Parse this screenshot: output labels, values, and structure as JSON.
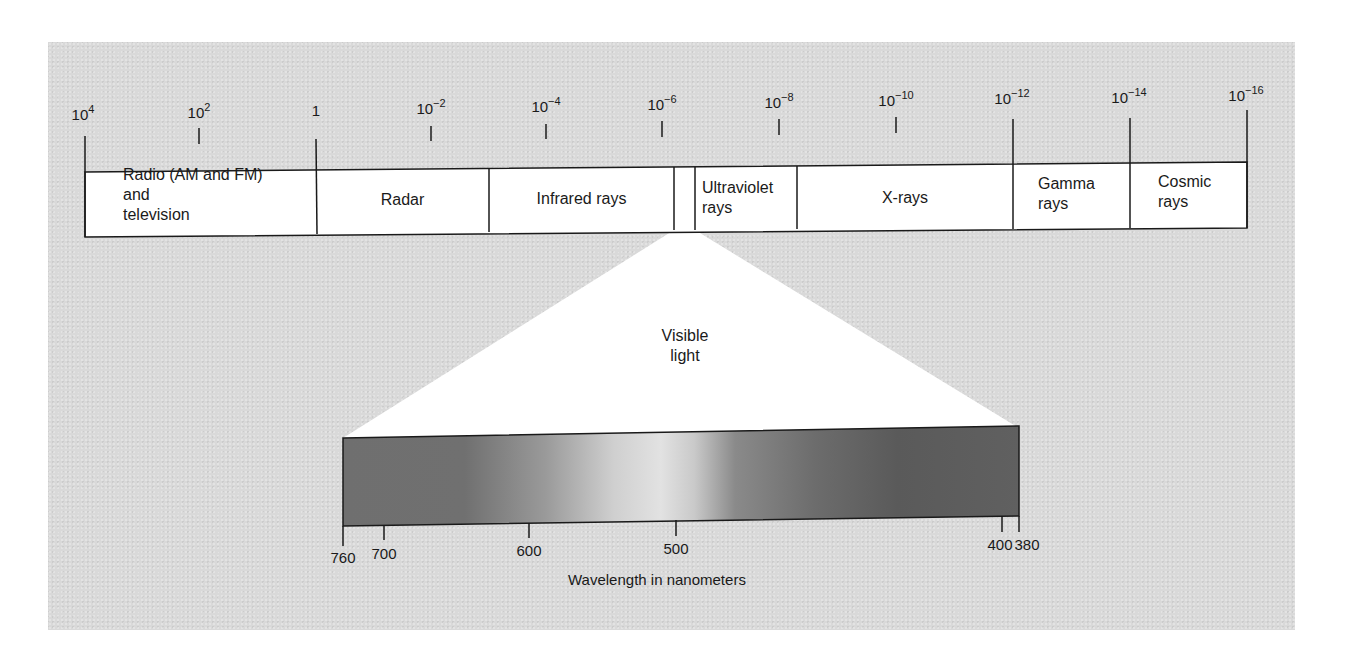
{
  "diagram": {
    "scale_ticks": [
      {
        "base": "10",
        "exp": "4",
        "x": 83
      },
      {
        "base": "10",
        "exp": "2",
        "x": 199
      },
      {
        "base": "1",
        "exp": "",
        "x": 316
      },
      {
        "base": "10",
        "exp": "−2",
        "x": 431
      },
      {
        "base": "10",
        "exp": "−4",
        "x": 546
      },
      {
        "base": "10",
        "exp": "−6",
        "x": 662
      },
      {
        "base": "10",
        "exp": "−8",
        "x": 779
      },
      {
        "base": "10",
        "exp": "−10",
        "x": 896
      },
      {
        "base": "10",
        "exp": "−12",
        "x": 1012
      },
      {
        "base": "10",
        "exp": "−14",
        "x": 1129
      },
      {
        "base": "10",
        "exp": "−16",
        "x": 1246
      }
    ],
    "bands": [
      {
        "label": "Radio (AM and FM)\nand\ntelevision",
        "x0": 85,
        "x1": 316,
        "align": "left"
      },
      {
        "label": "Radar",
        "x0": 316,
        "x1": 489,
        "align": "center"
      },
      {
        "label": "Infrared rays",
        "x0": 489,
        "x1": 674,
        "align": "center"
      },
      {
        "label": "",
        "x0": 674,
        "x1": 695,
        "align": "center"
      },
      {
        "label": "Ultraviolet\nrays",
        "x0": 695,
        "x1": 797,
        "align": "left"
      },
      {
        "label": "X-rays",
        "x0": 797,
        "x1": 1013,
        "align": "center"
      },
      {
        "label": "Gamma\nrays",
        "x0": 1013,
        "x1": 1130,
        "align": "left"
      },
      {
        "label": "Cosmic\nrays",
        "x0": 1130,
        "x1": 1247,
        "align": "left"
      }
    ],
    "visible_light_label": "Visible\nlight",
    "spectrum_ticks": [
      {
        "label": "760",
        "x": 343
      },
      {
        "label": "700",
        "x": 384
      },
      {
        "label": "600",
        "x": 529
      },
      {
        "label": "500",
        "x": 676
      },
      {
        "label": "400",
        "x": 1002
      },
      {
        "label": "380",
        "x": 1019
      }
    ],
    "xlabel": "Wavelength in nanometers",
    "colors": {
      "panel_bg": "#d9d9d9",
      "band_fill": "#ffffff",
      "line": "#1a1a1a",
      "spectrum_dark": "#6e6e6e",
      "spectrum_light": "#dcdcdc",
      "spectrum_darkest": "#555555"
    }
  }
}
